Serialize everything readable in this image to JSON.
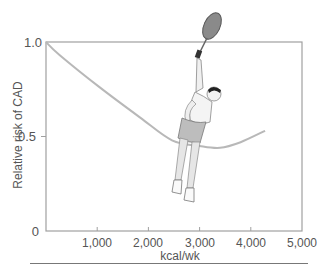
{
  "chart_data": {
    "type": "line",
    "title": "",
    "xlabel": "kcal/wk",
    "ylabel": "Relative risk of CAD",
    "xlim": [
      0,
      5000
    ],
    "ylim": [
      0,
      1.0
    ],
    "x_ticks": [
      "1,000",
      "2,000",
      "3,000",
      "4,000",
      "5,000"
    ],
    "y_ticks": [
      "0",
      "0.5",
      "1.0"
    ],
    "grid": false,
    "legend": null,
    "series": [
      {
        "name": "Relative risk of CAD",
        "color": "#b8b8b8",
        "x": [
          0,
          270,
          1050,
          1840,
          2460,
          3000,
          3400,
          3800,
          4280
        ],
        "y": [
          1.0,
          0.93,
          0.76,
          0.6,
          0.48,
          0.45,
          0.44,
          0.47,
          0.53
        ]
      }
    ],
    "annotations": [
      "illustration of tennis player serving"
    ]
  },
  "axes": {
    "x_label": "kcal/wk",
    "y_label": "Relative risk of CAD",
    "y_tick_0": "0",
    "y_tick_05": "0.5",
    "y_tick_10": "1.0",
    "x_ticks": [
      "1,000",
      "2,000",
      "3,000",
      "4,000",
      "5,000"
    ]
  },
  "colors": {
    "axis": "#9a9a9a",
    "curve": "#b8b8b8",
    "text": "#555555"
  }
}
